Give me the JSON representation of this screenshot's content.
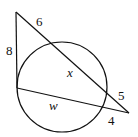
{
  "diagram": {
    "type": "circle-tangent-secant",
    "circle": {
      "cx": 62,
      "cy": 87,
      "r": 45
    },
    "points": {
      "top_vertex": [
        16,
        12
      ],
      "tangent_point": [
        17,
        88
      ],
      "right_vertex": [
        129,
        113
      ]
    },
    "labels": {
      "tangent_length": "8",
      "upper_external": "6",
      "upper_chord": "x",
      "upper_right_external": "5",
      "lower_chord": "w",
      "lower_external": "4"
    },
    "stroke_color": "#111111"
  }
}
